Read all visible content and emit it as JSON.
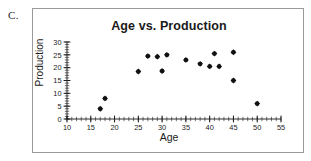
{
  "panel": {
    "label": "C."
  },
  "chart_data": {
    "type": "scatter",
    "title": "Age vs. Production",
    "xlabel": "Age",
    "ylabel": "Production",
    "xlim": [
      10,
      55
    ],
    "ylim": [
      0,
      30
    ],
    "xticks": [
      10,
      15,
      20,
      25,
      30,
      35,
      40,
      45,
      50,
      55
    ],
    "yticks": [
      0,
      5,
      10,
      15,
      20,
      25,
      30
    ],
    "xtick_labels": [
      "10",
      "15",
      "20",
      "25",
      "30",
      "35",
      "40",
      "45",
      "50",
      "55"
    ],
    "ytick_labels": [
      "0",
      "5",
      "10",
      "15",
      "20",
      "25",
      "30"
    ],
    "minor_tick_step": 1,
    "grid": false,
    "legend": false,
    "marker": "diamond",
    "marker_color": "#111111",
    "x": [
      17,
      18,
      25,
      27,
      29,
      30,
      31,
      35,
      38,
      40,
      41,
      42,
      45,
      45,
      50
    ],
    "y": [
      4,
      8,
      18.5,
      24.5,
      24.3,
      18.7,
      25,
      23,
      21.5,
      20.5,
      25.5,
      20.5,
      26,
      15,
      6
    ],
    "points": [
      {
        "x": 17,
        "y": 4
      },
      {
        "x": 18,
        "y": 8
      },
      {
        "x": 25,
        "y": 18.5
      },
      {
        "x": 27,
        "y": 24.5
      },
      {
        "x": 29,
        "y": 24.3
      },
      {
        "x": 30,
        "y": 18.7
      },
      {
        "x": 31,
        "y": 25
      },
      {
        "x": 35,
        "y": 23
      },
      {
        "x": 38,
        "y": 21.5
      },
      {
        "x": 40,
        "y": 20.5
      },
      {
        "x": 41,
        "y": 25.5
      },
      {
        "x": 42,
        "y": 20.5
      },
      {
        "x": 45,
        "y": 26
      },
      {
        "x": 45,
        "y": 15
      },
      {
        "x": 50,
        "y": 6
      }
    ]
  },
  "colors": {
    "border": "#9a9a9a",
    "axis": "#1a1a1a",
    "marker": "#111111",
    "background": "#ffffff"
  }
}
